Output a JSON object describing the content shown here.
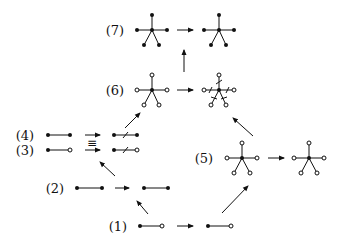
{
  "diagram": {
    "colors": {
      "ink": "#111111",
      "background": "#ffffff"
    },
    "labels": [
      {
        "id": "7",
        "text": "(7)",
        "x": 115,
        "y": 35
      },
      {
        "id": "6",
        "text": "(6)",
        "x": 115,
        "y": 95
      },
      {
        "id": "4",
        "text": "(4)",
        "x": 25,
        "y": 140
      },
      {
        "id": "3",
        "text": "(3)",
        "x": 25,
        "y": 155
      },
      {
        "id": "5",
        "text": "(5)",
        "x": 204,
        "y": 163
      },
      {
        "id": "2",
        "text": "(2)",
        "x": 55,
        "y": 193
      },
      {
        "id": "1",
        "text": "(1)",
        "x": 118,
        "y": 231
      }
    ],
    "equiv_symbol": "≡",
    "node_legend": {
      "filled": "filled vertex",
      "hollow": "hollow vertex"
    }
  }
}
